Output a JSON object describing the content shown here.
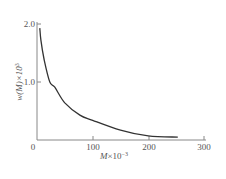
{
  "chart_data": {
    "type": "line",
    "title": "",
    "xlabel": "M×10⁻³",
    "ylabel": "w(M)×10³",
    "xlim": [
      0,
      300
    ],
    "ylim": [
      0,
      2.0
    ],
    "grid": false,
    "legend": null,
    "x_ticks": [
      "0",
      "100",
      "200",
      "300"
    ],
    "y_ticks": [
      "1.0",
      "2.0"
    ],
    "series": [
      {
        "name": "w(M)",
        "x": [
          5,
          7,
          13,
          23,
          32,
          50,
          77,
          100,
          150,
          200,
          253
        ],
        "y": [
          1.93,
          1.72,
          1.38,
          1.0,
          0.91,
          0.64,
          0.43,
          0.34,
          0.17,
          0.07,
          0.05
        ]
      }
    ]
  },
  "axes": {
    "x_label_main": "M",
    "x_label_suffix": "×10",
    "x_label_exp": "−3",
    "y_label_main": "w(M)×10",
    "y_label_exp": "3",
    "origin_label": "0",
    "x_tick_labels": [
      "100",
      "200",
      "300"
    ],
    "y_tick_labels": [
      "1.0",
      "2.0"
    ]
  },
  "colors": {
    "axis": "#777777",
    "curve": "#333333",
    "text": "#555555"
  }
}
